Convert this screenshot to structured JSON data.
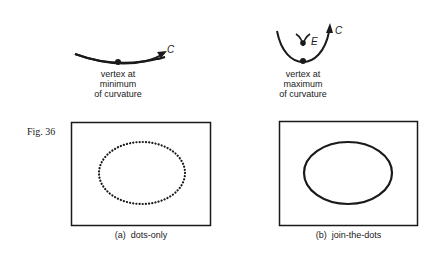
{
  "figure": {
    "number": "Fig. 36",
    "ink_color": "#1a1a1a"
  },
  "top_left": {
    "curve_label": "C",
    "caption_lines": [
      "vertex at",
      "minimum",
      "of curvature"
    ]
  },
  "top_right": {
    "curve_label": "C",
    "evolute_label": "E",
    "caption_lines": [
      "vertex at",
      "maximum",
      "of curvature"
    ]
  },
  "panel_a": {
    "caption_prefix": "(a)",
    "caption_text": "dots-only",
    "style": "dotted ellipse"
  },
  "panel_b": {
    "caption_prefix": "(b)",
    "caption_text": "join-the-dots",
    "style": "solid ellipse"
  }
}
